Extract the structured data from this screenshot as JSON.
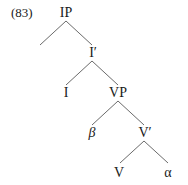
{
  "example": {
    "number": "(83)"
  },
  "tree": {
    "nodes": {
      "ip": "IP",
      "i_bar": "I′",
      "i": "I",
      "vp": "VP",
      "beta": "β",
      "v_bar": "V′",
      "v": "V",
      "alpha": "α"
    },
    "edges": [
      {
        "from": "IP",
        "to": "(empty left branch)"
      },
      {
        "from": "IP",
        "to": "I′"
      },
      {
        "from": "I′",
        "to": "I"
      },
      {
        "from": "I′",
        "to": "VP"
      },
      {
        "from": "VP",
        "to": "β"
      },
      {
        "from": "VP",
        "to": "V′"
      },
      {
        "from": "V′",
        "to": "V"
      },
      {
        "from": "V′",
        "to": "α"
      }
    ],
    "line_color": "#6b6b6b",
    "text_color": "#1a1a1a"
  }
}
